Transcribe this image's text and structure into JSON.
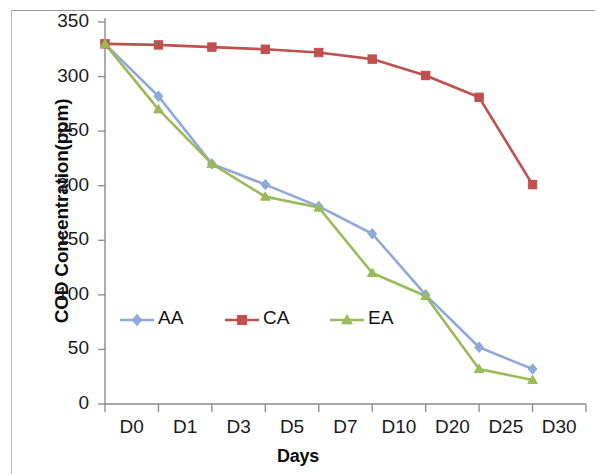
{
  "chart_data": {
    "type": "line",
    "title": "",
    "xlabel": "Days",
    "ylabel": "COD Concentration(ppm)",
    "categories": [
      "D0",
      "D1",
      "D3",
      "D5",
      "D7",
      "D10",
      "D20",
      "D25",
      "D30"
    ],
    "yticks": [
      0,
      50,
      100,
      150,
      200,
      250,
      300,
      350
    ],
    "ylim": [
      0,
      350
    ],
    "grid": false,
    "legend_position": "inside-lower-left",
    "series": [
      {
        "name": "AA",
        "color": "#8FA9DB",
        "marker": "diamond",
        "values": [
          330,
          282,
          220,
          201,
          181,
          156,
          100,
          52,
          32
        ]
      },
      {
        "name": "CA",
        "color": "#C0504D",
        "marker": "square",
        "values": [
          330,
          329,
          327,
          325,
          322,
          316,
          301,
          281,
          201
        ]
      },
      {
        "name": "EA",
        "color": "#9BBB59",
        "marker": "triangle",
        "values": [
          330,
          270,
          220,
          190,
          180,
          120,
          99,
          32,
          22
        ]
      }
    ]
  },
  "legend": {
    "items": [
      {
        "label": "AA"
      },
      {
        "label": "CA"
      },
      {
        "label": "EA"
      }
    ]
  },
  "axes": {
    "y_title": "COD Concentration(ppm)",
    "x_title": "Days"
  }
}
